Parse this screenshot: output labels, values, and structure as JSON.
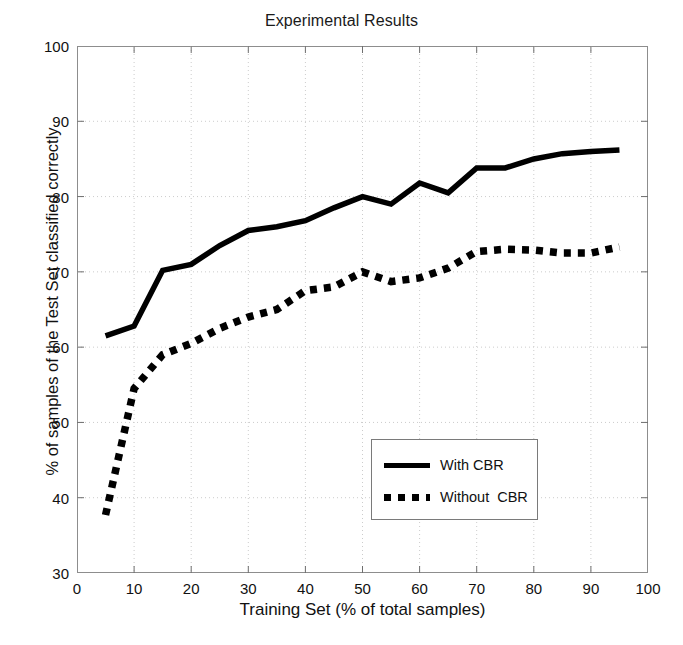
{
  "chart": {
    "title": "Experimental Results",
    "xlabel": "Training Set (% of total samples)",
    "ylabel": "% of samples of the Test Set classified correctly"
  },
  "axes": {
    "x_ticks": [
      "0",
      "10",
      "20",
      "30",
      "40",
      "50",
      "60",
      "70",
      "80",
      "90",
      "100"
    ],
    "y_ticks": [
      "100",
      "90",
      "80",
      "70",
      "60",
      "50",
      "40",
      "30"
    ]
  },
  "legend": {
    "items": [
      {
        "label": "With CBR",
        "style": "solid",
        "sample": "solid-line-swatch"
      },
      {
        "label": "Without  CBR",
        "style": "dashed",
        "sample": "dashed-line-swatch"
      }
    ]
  },
  "colors": {
    "line": "#000000",
    "axis": "#8d8d8d",
    "grid": "#cccccc",
    "background": "#ffffff",
    "text": "#111111"
  },
  "chart_data": {
    "type": "line",
    "title": "Experimental Results",
    "xlabel": "Training Set (% of total samples)",
    "ylabel": "% of samples of the Test Set classified correctly",
    "xlim": [
      0,
      100
    ],
    "ylim": [
      30,
      100
    ],
    "xticks": [
      0,
      10,
      20,
      30,
      40,
      50,
      60,
      70,
      80,
      90,
      100
    ],
    "yticks": [
      30,
      40,
      50,
      60,
      70,
      80,
      90,
      100
    ],
    "grid": true,
    "legend_position": "center-right-inside",
    "x": [
      5,
      10,
      15,
      20,
      25,
      30,
      35,
      40,
      45,
      50,
      55,
      60,
      65,
      70,
      75,
      80,
      85,
      90,
      95
    ],
    "series": [
      {
        "name": "With CBR",
        "style": "solid",
        "color": "#000000",
        "values": [
          61.5,
          62.8,
          70.2,
          71.0,
          73.5,
          75.5,
          76.0,
          76.8,
          78.5,
          80.0,
          79.0,
          81.8,
          80.5,
          83.8,
          83.8,
          85.0,
          85.7,
          86.0,
          86.2
        ]
      },
      {
        "name": "Without  CBR",
        "style": "dashed",
        "color": "#000000",
        "values": [
          37.7,
          54.5,
          59.0,
          60.5,
          62.5,
          64.0,
          65.0,
          67.5,
          68.0,
          70.0,
          68.7,
          69.2,
          70.5,
          72.7,
          73.0,
          72.9,
          72.5,
          72.5,
          73.3
        ]
      }
    ]
  }
}
